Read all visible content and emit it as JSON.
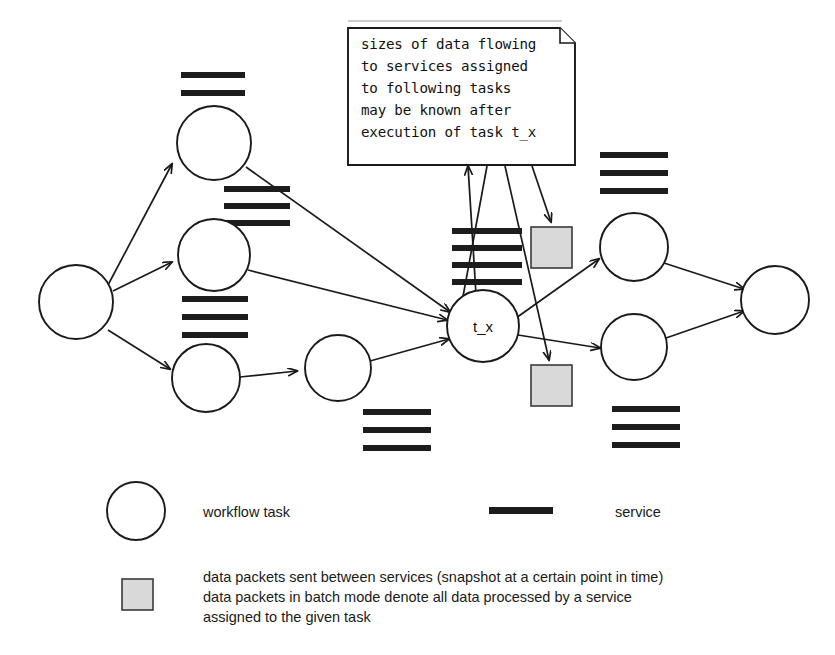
{
  "figure": {
    "clipped_title": "",
    "note": {
      "lines": [
        "sizes of data flowing",
        "to services assigned",
        "to following tasks",
        "may be known after",
        "execution of task t_x"
      ]
    },
    "nodes": [
      {
        "id": "n_start",
        "label": "",
        "cx": 76,
        "cy": 302,
        "r": 37
      },
      {
        "id": "n_top",
        "label": "",
        "cx": 214,
        "cy": 143,
        "r": 37
      },
      {
        "id": "n_mid",
        "label": "",
        "cx": 214,
        "cy": 255,
        "r": 36
      },
      {
        "id": "n_bot",
        "label": "",
        "cx": 206,
        "cy": 378,
        "r": 34
      },
      {
        "id": "n_bot2",
        "label": "",
        "cx": 338,
        "cy": 368,
        "r": 33
      },
      {
        "id": "n_tx",
        "label": "t_x",
        "cx": 483,
        "cy": 326,
        "r": 36
      },
      {
        "id": "n_rtop",
        "label": "",
        "cx": 634,
        "cy": 247,
        "r": 34
      },
      {
        "id": "n_rbot",
        "label": "",
        "cx": 634,
        "cy": 347,
        "r": 33
      },
      {
        "id": "n_end",
        "label": "",
        "cx": 775,
        "cy": 300,
        "r": 34
      }
    ],
    "service_groups": [
      {
        "id": "svc_top_left",
        "bars": 2,
        "x": 181,
        "y": 72,
        "width": 64,
        "bar_height": 6,
        "gap": 12
      },
      {
        "id": "svc_node1_out",
        "bars": 3,
        "x": 224,
        "y": 186,
        "width": 66,
        "bar_height": 6,
        "gap": 11
      },
      {
        "id": "svc_node2_below",
        "bars": 3,
        "x": 182,
        "y": 296,
        "width": 66,
        "bar_height": 6,
        "gap": 12
      },
      {
        "id": "svc_tx_above",
        "bars": 4,
        "x": 452,
        "y": 228,
        "width": 70,
        "bar_height": 6,
        "gap": 12
      },
      {
        "id": "svc_bottom_center",
        "bars": 3,
        "x": 363,
        "y": 409,
        "width": 68,
        "bar_height": 6,
        "gap": 12
      },
      {
        "id": "svc_right_top",
        "bars": 3,
        "x": 600,
        "y": 152,
        "width": 68,
        "bar_height": 6,
        "gap": 12
      },
      {
        "id": "svc_right_bottom",
        "bars": 3,
        "x": 612,
        "y": 406,
        "width": 68,
        "bar_height": 6,
        "gap": 12
      }
    ],
    "data_packets": [
      {
        "id": "packet_upper",
        "x": 531,
        "y": 227,
        "size": 41
      },
      {
        "id": "packet_lower",
        "x": 531,
        "y": 365,
        "size": 41
      }
    ],
    "edges": [
      {
        "id": "e_start_top",
        "from": "n_start",
        "to": "n_top"
      },
      {
        "id": "e_start_mid",
        "from": "n_start",
        "to": "n_mid"
      },
      {
        "id": "e_start_bot",
        "from": "n_start",
        "to": "n_bot"
      },
      {
        "id": "e_top_tx",
        "from": "n_top",
        "to": "n_tx"
      },
      {
        "id": "e_mid_tx",
        "from": "n_mid",
        "to": "n_tx"
      },
      {
        "id": "e_bot_bot2",
        "from": "n_bot",
        "to": "n_bot2"
      },
      {
        "id": "e_bot2_tx",
        "from": "n_bot2",
        "to": "n_tx"
      },
      {
        "id": "e_tx_rtop",
        "from": "n_tx",
        "to": "n_rtop"
      },
      {
        "id": "e_tx_rbot",
        "from": "n_tx",
        "to": "n_rbot"
      },
      {
        "id": "e_rtop_end",
        "from": "n_rtop",
        "to": "n_end"
      },
      {
        "id": "e_rbot_end",
        "from": "n_rbot",
        "to": "n_end"
      }
    ],
    "note_connectors": [
      {
        "id": "note_to_tx",
        "desc": "arrow from t_x up to note"
      },
      {
        "id": "note_to_services",
        "desc": "line from note down to services above t_x"
      },
      {
        "id": "note_to_packet_lower",
        "desc": "arrow from note down to lower data packet"
      },
      {
        "id": "note_to_packet_upper",
        "desc": "arrow from note down to upper data packet"
      }
    ]
  },
  "legend": {
    "items": [
      {
        "id": "legend-workflow-task",
        "symbol": "circle",
        "label": "workflow task"
      },
      {
        "id": "legend-service",
        "symbol": "bar",
        "label": "service"
      },
      {
        "id": "legend-data-packet",
        "symbol": "square",
        "label_lines": [
          "data packets sent between services (snapshot at a certain point in time)",
          "data packets in batch mode denote all data processed by a service",
          "assigned to the given task"
        ]
      }
    ]
  },
  "colors": {
    "ink": "#1a1a1a",
    "service_bar": "#1c1c1c",
    "packet_fill": "#d9d9d9",
    "packet_stroke": "#3a3a3a",
    "paper": "#ffffff",
    "rule": "#9a9a9a"
  }
}
